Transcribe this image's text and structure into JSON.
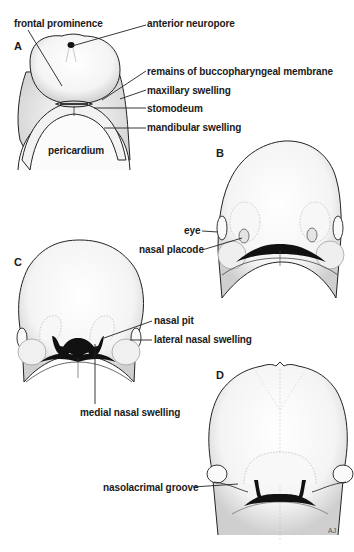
{
  "figure": {
    "panels": [
      {
        "id": "A",
        "label": "A"
      },
      {
        "id": "B",
        "label": "B"
      },
      {
        "id": "C",
        "label": "C"
      },
      {
        "id": "D",
        "label": "D"
      }
    ],
    "labels": {
      "frontal_prominence": "frontal prominence",
      "anterior_neuropore": "anterior neuropore",
      "remains_buccopharyngeal": "remains of buccopharyngeal membrane",
      "maxillary_swelling": "maxillary swelling",
      "stomodeum": "stomodeum",
      "mandibular_swelling": "mandibular swelling",
      "pericardium": "pericardium",
      "eye": "eye",
      "nasal_placode": "nasal placode",
      "nasal_pit": "nasal pit",
      "lateral_nasal_swelling": "lateral nasal swelling",
      "medial_nasal_swelling": "medial nasal swelling",
      "nasolacrimal_groove": "nasolacrimal groove"
    },
    "artist_initials": "AJ"
  }
}
